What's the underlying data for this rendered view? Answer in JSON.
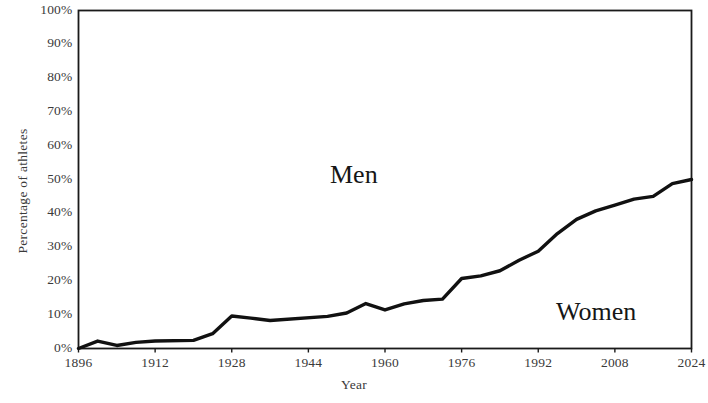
{
  "chart_data": {
    "type": "line",
    "title": "",
    "subtitle": "",
    "xlabel": "Year",
    "ylabel": "Percentage of athletes",
    "xlim": [
      1896,
      2024
    ],
    "ylim": [
      0,
      100
    ],
    "grid": false,
    "legend_position": "none",
    "x_tick_labels": [
      "1896",
      "1912",
      "1928",
      "1944",
      "1960",
      "1976",
      "1992",
      "2008",
      "2024"
    ],
    "x_tick_values": [
      1896,
      1912,
      1928,
      1944,
      1960,
      1976,
      1992,
      2008,
      2024
    ],
    "y_tick_labels": [
      "0%",
      "10%",
      "20%",
      "30%",
      "40%",
      "50%",
      "60%",
      "70%",
      "80%",
      "90%",
      "100%"
    ],
    "y_tick_values": [
      0,
      10,
      20,
      30,
      40,
      50,
      60,
      70,
      80,
      90,
      100
    ],
    "annotations": [
      {
        "name": "men-region",
        "text": "Men",
        "x": 1956,
        "y": 62
      },
      {
        "name": "women-region",
        "text": "Women",
        "x": 2006,
        "y": 17
      }
    ],
    "series": [
      {
        "name": "Women",
        "color": "#111111",
        "line_width": 3.4,
        "x": [
          1896,
          1900,
          1904,
          1908,
          1912,
          1920,
          1924,
          1928,
          1932,
          1936,
          1948,
          1952,
          1956,
          1960,
          1964,
          1968,
          1972,
          1976,
          1980,
          1984,
          1988,
          1992,
          1996,
          2000,
          2004,
          2008,
          2012,
          2016,
          2020,
          2024
        ],
        "values": [
          0,
          2.2,
          0.9,
          1.8,
          2.2,
          2.4,
          4.4,
          9.6,
          9.0,
          8.3,
          9.5,
          10.5,
          13.3,
          11.4,
          13.2,
          14.2,
          14.6,
          20.7,
          21.5,
          23.0,
          26.1,
          28.8,
          34.0,
          38.2,
          40.7,
          42.4,
          44.2,
          45.0,
          48.8,
          50.0
        ]
      }
    ]
  },
  "axes": {
    "x_title": "Year",
    "y_title": "Percentage of athletes"
  },
  "labels": {
    "men": "Men",
    "women": "Women"
  }
}
